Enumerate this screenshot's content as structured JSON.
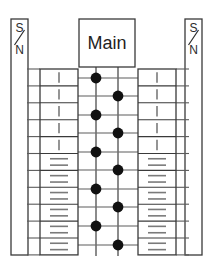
{
  "diagram": {
    "title": "Main",
    "type": "electrical-panel-schematic",
    "colors": {
      "background": "#ffffff",
      "outline": "#3a3a3a",
      "line": "#5c5c5c",
      "bus": "#6e6e6e",
      "node": "#111111",
      "dash": "#7a7a7a",
      "text": "#2b2b2b"
    }
  },
  "main_breaker": {
    "label": "Main",
    "x": 79,
    "y": 19,
    "width": 56,
    "height": 48
  },
  "side_rails": [
    {
      "name": "left-rail",
      "top_letter": "S",
      "bottom_letter": "N",
      "separator": "slash",
      "x": 11,
      "y": 19,
      "width": 17,
      "height": 236
    },
    {
      "name": "right-rail",
      "top_letter": "S",
      "bottom_letter": "N",
      "separator": "slash",
      "x": 185,
      "y": 19,
      "width": 17,
      "height": 236
    }
  ],
  "breaker_columns": [
    {
      "name": "left-breaker-column",
      "side": "left",
      "x": 40,
      "y": 69,
      "width": 38,
      "row_height": 16.9,
      "rows": [
        {
          "index": 1,
          "mark": "single-vertical-dash"
        },
        {
          "index": 2,
          "mark": "single-vertical-dash"
        },
        {
          "index": 3,
          "mark": "single-vertical-dash"
        },
        {
          "index": 4,
          "mark": "single-vertical-dash"
        },
        {
          "index": 5,
          "mark": "single-vertical-dash"
        },
        {
          "index": 6,
          "mark": "double-horizontal-dash"
        },
        {
          "index": 7,
          "mark": "double-horizontal-dash"
        },
        {
          "index": 8,
          "mark": "double-horizontal-dash"
        },
        {
          "index": 9,
          "mark": "double-horizontal-dash"
        },
        {
          "index": 10,
          "mark": "double-horizontal-dash"
        },
        {
          "index": 11,
          "mark": "double-horizontal-dash"
        }
      ]
    },
    {
      "name": "right-breaker-column",
      "side": "right",
      "x": 138,
      "y": 69,
      "width": 38,
      "row_height": 16.9,
      "rows": [
        {
          "index": 1,
          "mark": "single-vertical-dash"
        },
        {
          "index": 2,
          "mark": "single-vertical-dash"
        },
        {
          "index": 3,
          "mark": "single-vertical-dash"
        },
        {
          "index": 4,
          "mark": "single-vertical-dash"
        },
        {
          "index": 5,
          "mark": "single-vertical-dash"
        },
        {
          "index": 6,
          "mark": "double-horizontal-dash"
        },
        {
          "index": 7,
          "mark": "double-horizontal-dash"
        },
        {
          "index": 8,
          "mark": "double-horizontal-dash"
        },
        {
          "index": 9,
          "mark": "double-horizontal-dash"
        },
        {
          "index": 10,
          "mark": "double-horizontal-dash"
        },
        {
          "index": 11,
          "mark": "double-horizontal-dash"
        }
      ]
    }
  ],
  "bus_bars": [
    {
      "name": "bus-bar-left",
      "x": 96,
      "y_top": 67,
      "y_bottom": 256
    },
    {
      "name": "bus-bar-right",
      "x": 118,
      "y_top": 67,
      "y_bottom": 256
    }
  ],
  "connection_nodes": [
    {
      "index": 1,
      "bus": "left",
      "x": 96,
      "y": 78
    },
    {
      "index": 2,
      "bus": "right",
      "x": 118,
      "y": 96
    },
    {
      "index": 3,
      "bus": "left",
      "x": 96,
      "y": 115
    },
    {
      "index": 4,
      "bus": "right",
      "x": 118,
      "y": 133
    },
    {
      "index": 5,
      "bus": "left",
      "x": 96,
      "y": 152
    },
    {
      "index": 6,
      "bus": "right",
      "x": 118,
      "y": 170
    },
    {
      "index": 7,
      "bus": "left",
      "x": 96,
      "y": 189
    },
    {
      "index": 8,
      "bus": "right",
      "x": 118,
      "y": 207
    },
    {
      "index": 9,
      "bus": "left",
      "x": 96,
      "y": 226
    },
    {
      "index": 10,
      "bus": "right",
      "x": 118,
      "y": 245
    }
  ],
  "row_connectors": {
    "name": "row-connector-lines",
    "count": 11,
    "y_values": [
      78,
      96,
      115,
      133,
      152,
      170,
      189,
      207,
      226,
      245
    ],
    "left_x_start": 78,
    "right_x_end": 138
  },
  "tick_marks": {
    "name": "neutral-tick-marks",
    "left_column": {
      "x_start": 27,
      "x_end": 40,
      "count": 12
    },
    "right_column": {
      "x_start": 176,
      "x_end": 189,
      "count": 12
    }
  }
}
